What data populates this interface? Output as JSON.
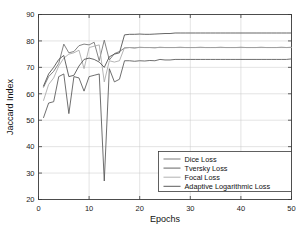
{
  "chart_data": {
    "type": "line",
    "title": "",
    "xlabel": "Epochs",
    "ylabel": "Jaccard Index",
    "xlim": [
      0,
      50
    ],
    "ylim": [
      20,
      90
    ],
    "xticks": [
      0,
      10,
      20,
      30,
      40,
      50
    ],
    "yticks": [
      20,
      30,
      40,
      50,
      60,
      70,
      80,
      90
    ],
    "xtick_labels": [
      "0",
      "10",
      "20",
      "30",
      "40",
      "50"
    ],
    "ytick_labels": [
      "20",
      "30",
      "40",
      "50",
      "60",
      "70",
      "80",
      "90"
    ],
    "grid": true,
    "legend_position": "lower right",
    "x": [
      1,
      2,
      3,
      4,
      5,
      6,
      7,
      8,
      9,
      10,
      11,
      12,
      13,
      14,
      15,
      16,
      17,
      18,
      19,
      20,
      21,
      22,
      23,
      24,
      25,
      26,
      27,
      28,
      29,
      30,
      31,
      32,
      33,
      34,
      35,
      36,
      37,
      38,
      39,
      40,
      41,
      42,
      43,
      44,
      45,
      46,
      47,
      48,
      49,
      50
    ],
    "series": [
      {
        "name": "Dice Loss",
        "color": "#6e6e6e",
        "values": [
          62.5,
          66.5,
          68.5,
          71.5,
          78.8,
          75.5,
          76.0,
          78.2,
          78.8,
          78.5,
          79.5,
          72.5,
          80.3,
          72.8,
          75.2,
          76.0,
          77.3,
          77.5,
          77.3,
          77.6,
          77.5,
          77.5,
          77.4,
          77.6,
          77.5,
          77.5,
          77.5,
          77.6,
          77.5,
          77.5,
          77.5,
          77.6,
          77.5,
          77.5,
          77.5,
          77.6,
          77.5,
          77.5,
          77.5,
          77.6,
          77.5,
          77.5,
          77.5,
          77.6,
          77.5,
          77.5,
          77.5,
          77.6,
          77.5,
          77.6
        ]
      },
      {
        "name": "Tversky Loss",
        "color": "#555555",
        "values": [
          51.0,
          56.5,
          57.0,
          66.5,
          67.5,
          52.5,
          66.5,
          66.0,
          61.0,
          66.5,
          67.0,
          67.5,
          27.0,
          69.5,
          64.5,
          65.5,
          72.5,
          72.5,
          72.3,
          72.5,
          72.4,
          72.6,
          72.5,
          73.0,
          72.8,
          72.8,
          73.0,
          73.0,
          73.0,
          73.0,
          73.0,
          73.0,
          73.0,
          73.0,
          73.0,
          73.0,
          73.0,
          73.0,
          73.0,
          73.0,
          73.0,
          73.0,
          73.0,
          73.0,
          73.0,
          73.0,
          73.0,
          73.0,
          73.0,
          73.2
        ]
      },
      {
        "name": "Focal Loss",
        "color": "#a8a8a8",
        "values": [
          57.5,
          63.5,
          66.0,
          70.5,
          73.5,
          75.0,
          75.5,
          76.5,
          69.5,
          77.5,
          78.0,
          78.5,
          64.5,
          72.5,
          72.0,
          72.5,
          77.5,
          77.5,
          77.5,
          77.5,
          77.5,
          77.5,
          77.5,
          77.5,
          77.5,
          77.5,
          77.5,
          77.5,
          77.5,
          77.5,
          77.5,
          77.5,
          77.5,
          77.5,
          77.5,
          77.5,
          77.5,
          77.5,
          77.5,
          77.5,
          77.5,
          77.5,
          77.5,
          77.5,
          77.5,
          77.5,
          77.5,
          77.5,
          77.5,
          77.5
        ]
      },
      {
        "name": "Adaptive Logarithmic Loss",
        "color": "#4a4a4a",
        "values": [
          63.0,
          67.5,
          70.0,
          73.0,
          74.5,
          66.5,
          67.0,
          70.5,
          73.0,
          73.5,
          73.0,
          72.0,
          70.0,
          74.0,
          75.0,
          75.5,
          82.3,
          82.5,
          82.5,
          82.6,
          82.5,
          82.5,
          82.6,
          82.7,
          82.8,
          82.8,
          83.0,
          83.0,
          83.0,
          83.0,
          83.0,
          83.0,
          83.0,
          83.0,
          83.0,
          83.0,
          83.0,
          83.0,
          83.0,
          83.0,
          83.0,
          83.0,
          83.0,
          83.0,
          83.0,
          83.0,
          83.0,
          83.0,
          83.0,
          83.0
        ]
      }
    ]
  },
  "legend": {
    "items": [
      {
        "label": "Dice Loss"
      },
      {
        "label": "Tversky Loss"
      },
      {
        "label": "Focal Loss"
      },
      {
        "label": "Adaptive Logarithmic Loss"
      }
    ]
  }
}
